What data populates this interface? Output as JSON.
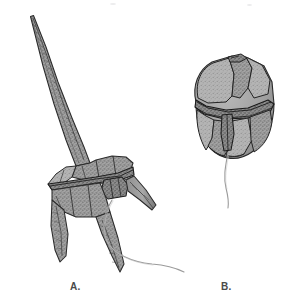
{
  "figure": {
    "kind": "scientific-illustration",
    "background_color": "#ffffff",
    "width": 302,
    "height": 307,
    "panels": [
      {
        "id": "A",
        "label": "A.",
        "organism": "armored dinoflagellate with elongated apical horn",
        "label_x": 70,
        "label_y": 281,
        "features": [
          "apical-horn",
          "epitheca",
          "cingulum",
          "sulcus",
          "hypotheca",
          "left-antapical-horn",
          "right-antapical-horn",
          "lateral-horn",
          "trailing-flagellum"
        ]
      },
      {
        "id": "B",
        "label": "B.",
        "organism": "rounded armored dinoflagellate with thecal plates",
        "label_x": 221,
        "label_y": 281,
        "features": [
          "epitheca-plates",
          "apical-plate",
          "cingulum",
          "sulcus",
          "hypotheca-plates",
          "antapical-plates",
          "trailing-flagellum"
        ]
      }
    ],
    "palette": {
      "body_fill": "#9a9a9a",
      "body_fill_light": "#b0b0b0",
      "body_fill_dark": "#7e7e7e",
      "outline": "#2e2e2e",
      "suture": "#1f1f1f",
      "flagellum": "#8e8e8e",
      "label_text": "#4a4a4a",
      "background": "#ffffff"
    }
  }
}
